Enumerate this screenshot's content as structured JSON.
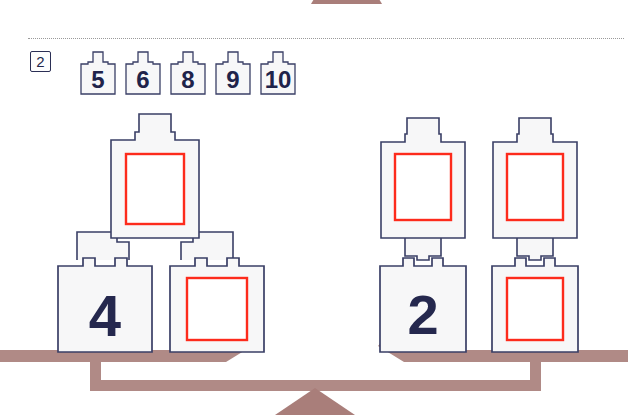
{
  "page": {
    "width": 628,
    "height": 415,
    "background": "#ffffff",
    "type": "math-worksheet-balance-puzzle"
  },
  "colors": {
    "beam": "#b08a86",
    "beam_shadow": "#a07b77",
    "tile_stroke": "#3a3f66",
    "tile_fill": "#f7f7f8",
    "answer_box": "#fd2b1c",
    "glyph": "#22254a",
    "rule": "#9a9a9a",
    "badge_border": "#2b2f55"
  },
  "previous_exercise": {
    "label": "partial-balance-from-previous-exercise",
    "visible": "top beam and fulcrum cropped by page edge"
  },
  "separator": {
    "style": "dotted",
    "label": "exercise-separator"
  },
  "exercise": {
    "number": "2",
    "number_cards": [
      {
        "value": "5"
      },
      {
        "value": "6"
      },
      {
        "value": "8"
      },
      {
        "value": "9"
      },
      {
        "value": "10"
      }
    ]
  },
  "left_group": {
    "label": "left-balance-pan-pyramid",
    "tiles": [
      {
        "id": "left-top",
        "value": "",
        "answer_box": true,
        "row": "top"
      },
      {
        "id": "left-bottom-left",
        "value": "4",
        "answer_box": false,
        "row": "bottom"
      },
      {
        "id": "left-bottom-right",
        "value": "",
        "answer_box": true,
        "row": "bottom"
      }
    ]
  },
  "right_group": {
    "label": "right-balance-pan-stacks",
    "tiles": [
      {
        "id": "right-col1-top",
        "value": "",
        "answer_box": true,
        "row": "top"
      },
      {
        "id": "right-col2-top",
        "value": "",
        "answer_box": true,
        "row": "top"
      },
      {
        "id": "right-col1-bottom",
        "value": "2",
        "answer_box": false,
        "row": "bottom"
      },
      {
        "id": "right-col2-bottom",
        "value": "",
        "answer_box": true,
        "row": "bottom"
      }
    ]
  },
  "bottom_balance": {
    "label": "balance-scale",
    "state": "level"
  }
}
